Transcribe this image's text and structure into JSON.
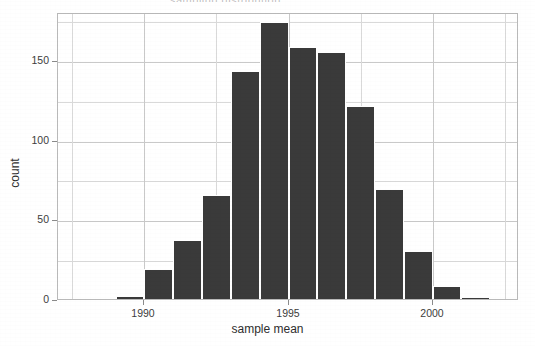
{
  "figure": {
    "background": "#ffffff",
    "panel_border_color": "#b9b9b9",
    "grid_color": "#d9d9d9",
    "bar_color": "#3a3a3a",
    "title_sliver": "sampling distribution"
  },
  "chart_data": {
    "type": "bar",
    "title": "",
    "subtitle": "",
    "xlabel": "sample mean",
    "ylabel": "count",
    "xlim": [
      1987.0,
      2003.0
    ],
    "ylim": [
      0,
      180
    ],
    "grid": true,
    "legend": null,
    "x_ticks": [
      1990,
      1995,
      2000
    ],
    "x_tick_labels": [
      "1990",
      "1995",
      "2000"
    ],
    "x_minor_ticks": [
      1987.5,
      1992.5,
      1997.5,
      2002.5
    ],
    "y_ticks": [
      0,
      50,
      100,
      150
    ],
    "y_tick_labels": [
      "0",
      "50",
      "100",
      "150"
    ],
    "y_minor_ticks": [
      25,
      75,
      125,
      175
    ],
    "bin_width": 1,
    "bin_starts": [
      1989.0,
      1990.0,
      1991.0,
      1992.0,
      1993.0,
      1994.0,
      1995.0,
      1996.0,
      1997.0,
      1998.0,
      1999.0,
      2000.0,
      2001.0
    ],
    "categories": [
      "1989",
      "1990",
      "1991",
      "1992",
      "1993",
      "1994",
      "1995",
      "1996",
      "1997",
      "1998",
      "1999",
      "2000",
      "2001"
    ],
    "values": [
      2,
      19,
      37,
      65,
      143,
      174,
      158,
      155,
      121,
      69,
      30,
      8,
      1
    ]
  }
}
